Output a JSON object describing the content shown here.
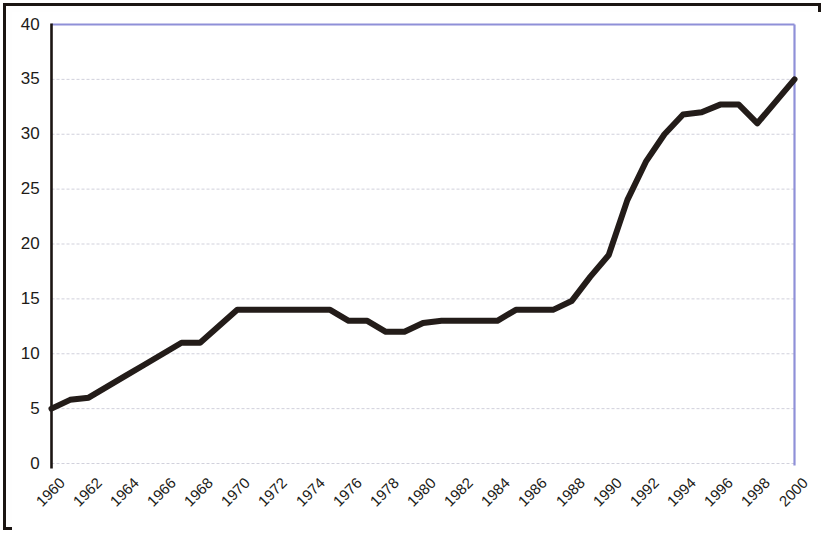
{
  "chart_data": {
    "type": "line",
    "title": "",
    "xlabel": "",
    "ylabel": "",
    "x": [
      1960,
      1961,
      1962,
      1963,
      1964,
      1965,
      1966,
      1967,
      1968,
      1969,
      1970,
      1971,
      1972,
      1973,
      1974,
      1975,
      1976,
      1977,
      1978,
      1979,
      1980,
      1981,
      1982,
      1983,
      1984,
      1985,
      1986,
      1987,
      1988,
      1989,
      1990,
      1991,
      1992,
      1993,
      1994,
      1995,
      1996,
      1997,
      1998,
      1999,
      2000
    ],
    "values": [
      5,
      5.8,
      6,
      7,
      8,
      9,
      10,
      11,
      11,
      12.5,
      14,
      14,
      14,
      14,
      14,
      14,
      13,
      13,
      12,
      12,
      12.8,
      13,
      13,
      13,
      13,
      14,
      14,
      14,
      14.8,
      17,
      19,
      24,
      27.5,
      30,
      31.8,
      32,
      32.7,
      32.7,
      31,
      33,
      35
    ],
    "ylim": [
      0,
      40
    ],
    "xlim": [
      1960,
      2000
    ],
    "yticks": [
      0,
      5,
      10,
      15,
      20,
      25,
      30,
      35,
      40
    ],
    "xticks": [
      1960,
      1962,
      1964,
      1966,
      1968,
      1970,
      1972,
      1974,
      1976,
      1978,
      1980,
      1982,
      1984,
      1986,
      1988,
      1990,
      1992,
      1994,
      1996,
      1998,
      2000
    ],
    "xtick_labels": [
      "1960",
      "1962",
      "1964",
      "1966",
      "1968",
      "1970",
      "1972",
      "1974",
      "1976",
      "1978",
      "1980",
      "1982",
      "1984",
      "1986",
      "1988",
      "1990",
      "1992",
      "1994",
      "1996",
      "1998",
      "2000"
    ],
    "ytick_labels": [
      "0",
      "5",
      "10",
      "15",
      "20",
      "25",
      "30",
      "35",
      "40"
    ],
    "grid": true,
    "grid_axis": "y",
    "legend": null,
    "series_color": "#231c19",
    "grid_color": "#c9c9d6",
    "axis_color": "#1b1512",
    "plot_border_color": "#8f90d8",
    "background_color": "#ffffff",
    "line_width": 6
  },
  "figure": {
    "frame_color": "#1b1512",
    "paper_color": "#ffffff"
  }
}
